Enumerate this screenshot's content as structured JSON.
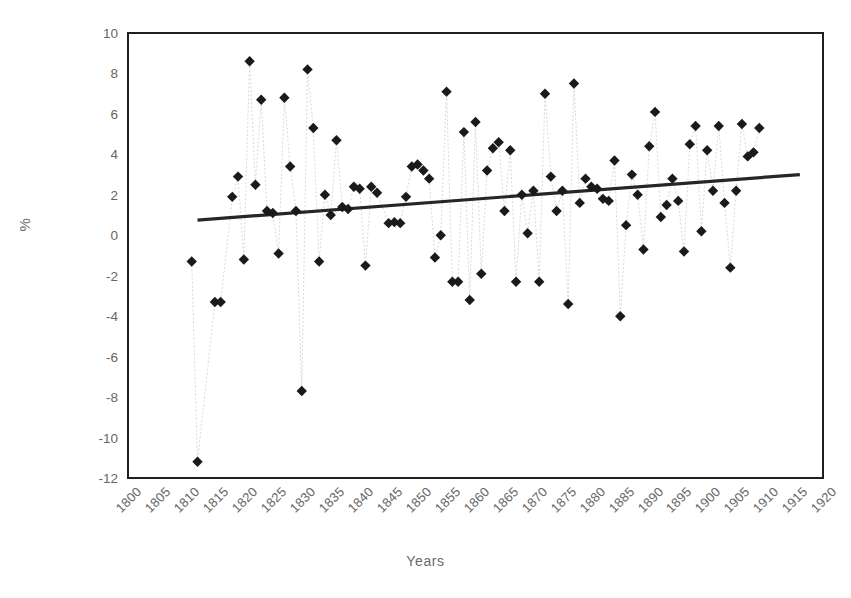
{
  "chart_data": {
    "type": "scatter",
    "title": "",
    "xlabel": "Years",
    "ylabel": "%",
    "xlim": [
      1800,
      1920
    ],
    "ylim": [
      -12,
      10
    ],
    "grid": false,
    "legend": false,
    "x_ticks": [
      "1800",
      "1805",
      "1810",
      "1815",
      "1820",
      "1825",
      "1830",
      "1835",
      "1840",
      "1845",
      "1850",
      "1855",
      "1860",
      "1865",
      "1870",
      "1875",
      "1880",
      "1885",
      "1890",
      "1895",
      "1900",
      "1905",
      "1910",
      "1915",
      "1920"
    ],
    "y_ticks": [
      "10",
      "8",
      "6",
      "4",
      "2",
      "0",
      "-2",
      "-4",
      "-6",
      "-8",
      "-10",
      "-12"
    ],
    "marker_style": "diamond",
    "marker_color": "#1a1a1a",
    "connector_color": "#d9d9d9",
    "trendline": {
      "type": "linear",
      "color": "#262626",
      "x_start": 1812,
      "y_start": 0.75,
      "x_end": 1916,
      "y_end": 3.0
    },
    "series": [
      {
        "name": "Annual change (%)",
        "points": [
          [
            1811,
            -1.3
          ],
          [
            1812,
            -11.2
          ],
          [
            1815,
            -3.3
          ],
          [
            1816,
            -3.3
          ],
          [
            1818,
            1.9
          ],
          [
            1819,
            2.9
          ],
          [
            1820,
            -1.2
          ],
          [
            1821,
            8.6
          ],
          [
            1822,
            2.5
          ],
          [
            1823,
            6.7
          ],
          [
            1824,
            1.2
          ],
          [
            1825,
            1.1
          ],
          [
            1826,
            -0.9
          ],
          [
            1827,
            6.8
          ],
          [
            1828,
            3.4
          ],
          [
            1829,
            1.2
          ],
          [
            1830,
            -7.7
          ],
          [
            1831,
            8.2
          ],
          [
            1832,
            5.3
          ],
          [
            1833,
            -1.3
          ],
          [
            1834,
            2.0
          ],
          [
            1835,
            1.0
          ],
          [
            1836,
            4.7
          ],
          [
            1837,
            1.4
          ],
          [
            1838,
            1.3
          ],
          [
            1839,
            2.4
          ],
          [
            1840,
            2.3
          ],
          [
            1841,
            -1.5
          ],
          [
            1842,
            2.4
          ],
          [
            1843,
            2.1
          ],
          [
            1845,
            0.6
          ],
          [
            1846,
            0.65
          ],
          [
            1847,
            0.6
          ],
          [
            1848,
            1.9
          ],
          [
            1849,
            3.4
          ],
          [
            1850,
            3.5
          ],
          [
            1851,
            3.2
          ],
          [
            1852,
            2.8
          ],
          [
            1853,
            -1.1
          ],
          [
            1854,
            0.0
          ],
          [
            1855,
            7.1
          ],
          [
            1856,
            -2.3
          ],
          [
            1857,
            -2.3
          ],
          [
            1858,
            5.1
          ],
          [
            1859,
            -3.2
          ],
          [
            1860,
            5.6
          ],
          [
            1861,
            -1.9
          ],
          [
            1862,
            3.2
          ],
          [
            1863,
            4.3
          ],
          [
            1864,
            4.6
          ],
          [
            1865,
            1.2
          ],
          [
            1866,
            4.2
          ],
          [
            1867,
            -2.3
          ],
          [
            1868,
            2.0
          ],
          [
            1869,
            0.1
          ],
          [
            1870,
            2.2
          ],
          [
            1871,
            -2.3
          ],
          [
            1872,
            7.0
          ],
          [
            1873,
            2.9
          ],
          [
            1874,
            1.2
          ],
          [
            1875,
            2.2
          ],
          [
            1876,
            -3.4
          ],
          [
            1877,
            7.5
          ],
          [
            1878,
            1.6
          ],
          [
            1879,
            2.8
          ],
          [
            1880,
            2.4
          ],
          [
            1881,
            2.3
          ],
          [
            1882,
            1.8
          ],
          [
            1883,
            1.7
          ],
          [
            1884,
            3.7
          ],
          [
            1885,
            -4.0
          ],
          [
            1886,
            0.5
          ],
          [
            1887,
            3.0
          ],
          [
            1888,
            2.0
          ],
          [
            1889,
            -0.7
          ],
          [
            1890,
            4.4
          ],
          [
            1891,
            6.1
          ],
          [
            1892,
            0.9
          ],
          [
            1893,
            1.5
          ],
          [
            1894,
            2.8
          ],
          [
            1895,
            1.7
          ],
          [
            1896,
            -0.8
          ],
          [
            1897,
            4.5
          ],
          [
            1898,
            5.4
          ],
          [
            1899,
            0.2
          ],
          [
            1900,
            4.2
          ],
          [
            1901,
            2.2
          ],
          [
            1902,
            5.4
          ],
          [
            1903,
            1.6
          ],
          [
            1904,
            -1.6
          ],
          [
            1905,
            2.2
          ],
          [
            1906,
            5.5
          ],
          [
            1907,
            3.9
          ],
          [
            1908,
            4.1
          ],
          [
            1909,
            5.3
          ]
        ]
      }
    ]
  },
  "axis_titles": {
    "y": "%",
    "x": "Years"
  }
}
